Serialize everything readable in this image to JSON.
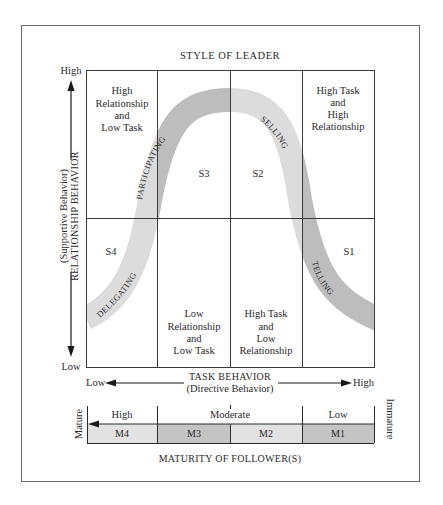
{
  "title": "STYLE OF LEADER",
  "y_axis": {
    "high": "High",
    "low": "Low",
    "label_main": "RELATIONSHIP BEHAVIOR",
    "label_sub": "(Supportive Behavior)"
  },
  "x_axis": {
    "low": "Low",
    "high": "High",
    "label_main": "TASK BEHAVIOR",
    "label_sub": "(Directive Behavior)"
  },
  "quadrants": {
    "top_left": [
      "High",
      "Relationship",
      "and",
      "Low Task"
    ],
    "top_right": [
      "High Task",
      "and",
      "High",
      "Relationship"
    ],
    "bottom_left": [
      "Low",
      "Relationship",
      "and",
      "Low Task"
    ],
    "bottom_right": [
      "High Task",
      "and",
      "Low",
      "Relationship"
    ]
  },
  "styles": {
    "s1": "S1",
    "s2": "S2",
    "s3": "S3",
    "s4": "S4"
  },
  "curve_labels": {
    "delegating": "DELEGATING",
    "participating": "PARTICIPATING",
    "selling": "SELLING",
    "telling": "TELLING"
  },
  "maturity": {
    "high": "High",
    "moderate": "Moderate",
    "low": "Low",
    "mature": "Mature",
    "immature": "Immature",
    "levels": [
      "M4",
      "M3",
      "M2",
      "M1"
    ],
    "title": "MATURITY OF FOLLOWER(S)"
  },
  "colors": {
    "band_dark": "#bdbdbd",
    "band_light": "#dcdcdc",
    "line": "#3a3a3a",
    "frame": "#6a6a6a"
  }
}
